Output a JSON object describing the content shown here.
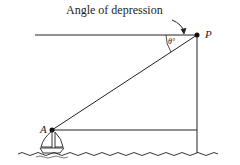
{
  "diagram": {
    "title": "Angle of depression",
    "points": {
      "P": {
        "label": "P"
      },
      "A": {
        "label": "A"
      }
    },
    "angle_label": "θ°",
    "colors": {
      "line": "#222222",
      "background": "#ffffff"
    }
  }
}
